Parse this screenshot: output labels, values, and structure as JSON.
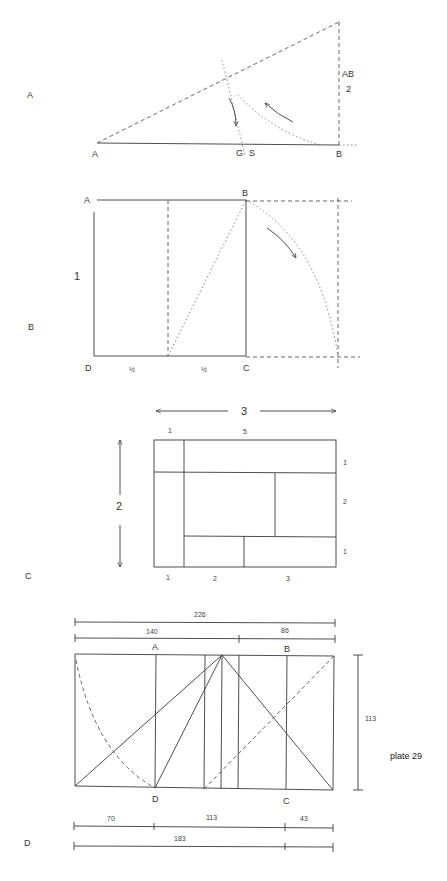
{
  "caption": "plate 29",
  "sections": {
    "A": {
      "section_label": "A",
      "points": {
        "A": "A",
        "B": "B",
        "G": "G",
        "S": "S"
      },
      "ratio_label_top": "AB",
      "ratio_label_bottom": "2"
    },
    "B": {
      "section_label": "B",
      "points": {
        "A": "A",
        "B": "B",
        "C": "C",
        "D": "D"
      },
      "side_label": "1",
      "half_left": "½",
      "half_right": "½"
    },
    "C": {
      "section_label": "C",
      "width_label": "3",
      "height_label": "2",
      "top_labels": [
        "1",
        "5"
      ],
      "right_labels": [
        "1",
        "2",
        "1"
      ],
      "bottom_labels": [
        "1",
        "2",
        "3"
      ]
    },
    "D": {
      "section_label": "D",
      "points": {
        "A": "A",
        "B": "B",
        "C": "C",
        "D": "D"
      },
      "dim_total": "226",
      "dim_major": "140",
      "dim_minor": "86",
      "dim_height": "113",
      "dim_bottom": [
        "70",
        "113",
        "43"
      ],
      "dim_bottom_total": "183"
    }
  }
}
